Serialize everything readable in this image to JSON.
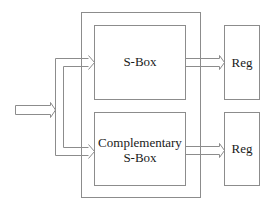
{
  "diagram": {
    "blocks": {
      "sbox": {
        "label": "S-Box"
      },
      "comp_sbox": {
        "label_line1": "Complementary",
        "label_line2": "S-Box"
      },
      "reg_top": {
        "label": "Reg"
      },
      "reg_bottom": {
        "label": "Reg"
      }
    },
    "colors": {
      "stroke": "#8c8c8c",
      "text": "#1a1a1a",
      "background": "#ffffff"
    }
  }
}
